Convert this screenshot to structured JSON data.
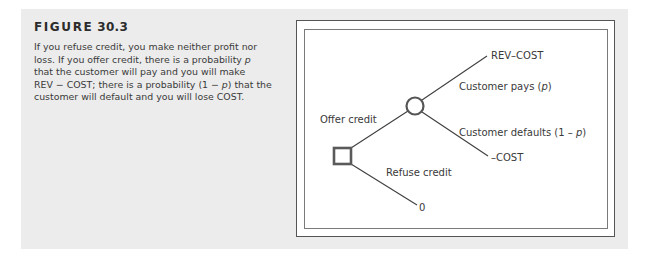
{
  "figure": {
    "label": "FIGURE",
    "number": "30.3"
  },
  "caption": {
    "lines": [
      "If you refuse credit, you make neither profit nor",
      "loss. If you offer credit, there is a probability ",
      "that the customer will pay and you will make",
      "REV − COST; there is a probability (1 − ",
      "customer will default and you will lose COST."
    ],
    "line2_var": "p",
    "line4_var": "p",
    "line4_tail": ") that the"
  },
  "diagram": {
    "decision_node": {
      "shape": "square",
      "x": 342,
      "y": 156,
      "size": 18
    },
    "chance_node": {
      "shape": "circle",
      "x": 415,
      "y": 106,
      "r": 9
    },
    "branches": {
      "offer": {
        "label": "Offer credit"
      },
      "refuse": {
        "label": "Refuse credit",
        "payoff": "0"
      },
      "pays": {
        "label_prefix": "Customer pays (",
        "label_var": "p",
        "label_suffix": ")",
        "payoff": "REV–COST"
      },
      "defaults": {
        "label_prefix": "Customer defaults (1 – ",
        "label_var": "p",
        "label_suffix": ")",
        "payoff": "–COST"
      }
    },
    "colors": {
      "line": "#3f3f3f",
      "node": "#5a5a5a",
      "panel": "#ececec"
    }
  }
}
